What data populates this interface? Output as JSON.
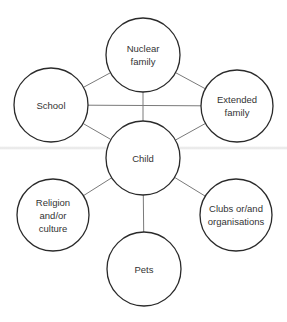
{
  "diagram": {
    "type": "network",
    "title": "",
    "colors": {
      "background": "#ffffff",
      "circle_stroke": "#2a2a2a",
      "connector": "#7a7a7a",
      "text": "#333333"
    },
    "nodes": [
      {
        "id": "nuclear",
        "lines": [
          "Nuclear",
          "family"
        ],
        "cx": 143,
        "cy": 55,
        "r": 37
      },
      {
        "id": "school",
        "lines": [
          "School"
        ],
        "cx": 51,
        "cy": 105,
        "r": 37
      },
      {
        "id": "extended",
        "lines": [
          "Extended",
          "family"
        ],
        "cx": 237,
        "cy": 106,
        "r": 36
      },
      {
        "id": "child",
        "lines": [
          "Child"
        ],
        "cx": 143,
        "cy": 158,
        "r": 37
      },
      {
        "id": "religion",
        "lines": [
          "Religion",
          "and/or",
          "culture"
        ],
        "cx": 53,
        "cy": 215,
        "r": 36
      },
      {
        "id": "clubs",
        "lines": [
          "Clubs or/and",
          "organisations"
        ],
        "cx": 236,
        "cy": 215,
        "r": 36
      },
      {
        "id": "pets",
        "lines": [
          "Pets"
        ],
        "cx": 144,
        "cy": 269,
        "r": 37
      }
    ],
    "edges": [
      {
        "from": "school",
        "to": "nuclear"
      },
      {
        "from": "nuclear",
        "to": "extended"
      },
      {
        "from": "school",
        "to": "extended"
      },
      {
        "from": "nuclear",
        "to": "child"
      },
      {
        "from": "school",
        "to": "child"
      },
      {
        "from": "extended",
        "to": "child"
      },
      {
        "from": "child",
        "to": "religion"
      },
      {
        "from": "child",
        "to": "clubs"
      },
      {
        "from": "child",
        "to": "pets"
      }
    ]
  }
}
